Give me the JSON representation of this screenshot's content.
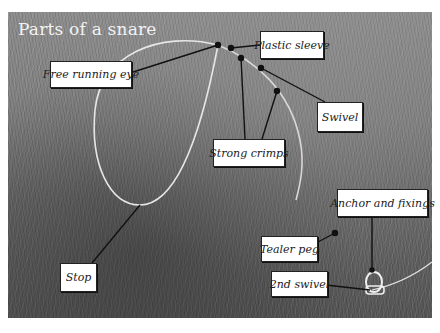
{
  "title": "Parts of a snare",
  "labels": {
    "free_running_eye": "Free running eye",
    "plastic_sleeve": "Plastic sleeve",
    "swivel": "Swivel",
    "strong_crimps": "Strong crimps",
    "anchor_and_fixings": "Anchor and fixings",
    "tealer_peg": "Tealer peg",
    "second_swivel": "2nd swivel",
    "stop": "Stop"
  },
  "colors": {
    "label_bg": "#ffffff",
    "leader_line": "#111111",
    "wire": "#e6e6e6",
    "title": "#f2f2f2"
  }
}
